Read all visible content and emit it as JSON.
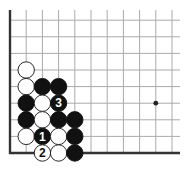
{
  "diagram": {
    "type": "go-board-diagram",
    "region": "lower-left corner",
    "grid": {
      "origin_x": 10,
      "origin_y": 153,
      "col_spacing": 16.2,
      "row_spacing": 16.6,
      "cols": 11,
      "rows": 9,
      "line_right_extent": 180,
      "line_top_extent": 10,
      "line_color": "#aaaaaa",
      "edge_color": "#333333"
    },
    "star_points": [
      {
        "col": 9,
        "row": 3
      }
    ],
    "stones": [
      {
        "color": "white",
        "col": 1,
        "row": 5,
        "label": ""
      },
      {
        "color": "white",
        "col": 1,
        "row": 4,
        "label": ""
      },
      {
        "color": "black",
        "col": 2,
        "row": 4,
        "label": ""
      },
      {
        "color": "black",
        "col": 3,
        "row": 4,
        "label": ""
      },
      {
        "color": "black",
        "col": 1,
        "row": 3,
        "label": ""
      },
      {
        "color": "white",
        "col": 2,
        "row": 3,
        "label": ""
      },
      {
        "color": "black",
        "col": 3,
        "row": 3,
        "label": "3"
      },
      {
        "color": "black",
        "col": 1,
        "row": 2,
        "label": ""
      },
      {
        "color": "white",
        "col": 2,
        "row": 2,
        "label": ""
      },
      {
        "color": "black",
        "col": 3,
        "row": 2,
        "label": ""
      },
      {
        "color": "black",
        "col": 4,
        "row": 2,
        "label": ""
      },
      {
        "color": "white",
        "col": 1,
        "row": 1,
        "label": ""
      },
      {
        "color": "black",
        "col": 2,
        "row": 1,
        "label": "1"
      },
      {
        "color": "white",
        "col": 3,
        "row": 1,
        "label": ""
      },
      {
        "color": "black",
        "col": 4,
        "row": 1,
        "label": ""
      },
      {
        "color": "white",
        "col": 2,
        "row": 0,
        "label": "2"
      },
      {
        "color": "white",
        "col": 3,
        "row": 0,
        "label": ""
      },
      {
        "color": "black",
        "col": 4,
        "row": 0,
        "label": ""
      }
    ]
  }
}
